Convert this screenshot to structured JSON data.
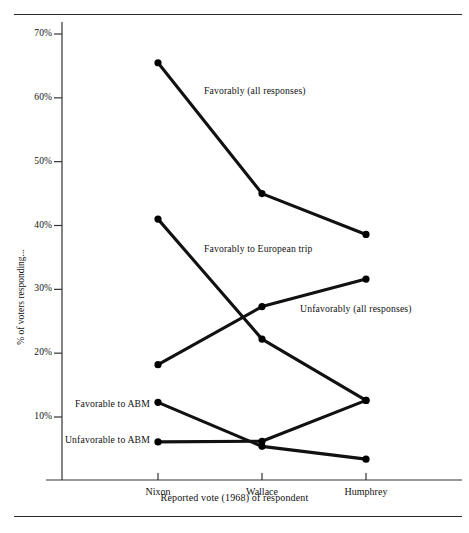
{
  "chart_data": {
    "type": "line",
    "title": "",
    "xlabel": "Reported vote (1968) of respondent",
    "ylabel": "% of voters responding...",
    "categories": [
      "Nixon",
      "Wallace",
      "Humphrey"
    ],
    "ylim": [
      0,
      72
    ],
    "yticks": [
      10,
      20,
      30,
      40,
      50,
      60,
      70
    ],
    "ytick_labels": [
      "10%",
      "20%",
      "30%",
      "40%",
      "50%",
      "60%",
      "70%"
    ],
    "grid": false,
    "legend_position": "inline-annotations",
    "series": [
      {
        "name": "Favorably (all responses)",
        "label": "Favorably (all responses)",
        "values": [
          65.5,
          45.0,
          38.6
        ],
        "label_x_px": 204,
        "label_y_px": 85,
        "label_align": "left"
      },
      {
        "name": "Favorably to European trip",
        "label": "Favorably to European trip",
        "values": [
          41.0,
          22.2,
          12.6
        ],
        "label_x_px": 204,
        "label_y_px": 243,
        "label_align": "left"
      },
      {
        "name": "Unfavorably (all responses)",
        "label": "Unfavorably (all responses)",
        "values": [
          18.2,
          27.3,
          31.6
        ],
        "label_x_px": 300,
        "label_y_px": 303,
        "label_align": "left"
      },
      {
        "name": "Favorable to ABM",
        "label": "Favorable to ABM",
        "values": [
          12.3,
          5.4,
          3.4
        ],
        "label_x_px": 150,
        "label_y_px": 398,
        "label_align": "right"
      },
      {
        "name": "Unfavorable to ABM",
        "label": "Unfavorable to ABM",
        "values": [
          6.1,
          6.2,
          12.6
        ],
        "label_x_px": 150,
        "label_y_px": 434,
        "label_align": "right"
      }
    ],
    "colors": {
      "line": "#111111",
      "marker": "#000000",
      "axis": "#333333",
      "rule": "#2a2a2a",
      "background": "#ffffff"
    }
  },
  "axis": {
    "x_tick_labels": [
      "Nixon",
      "Wallace",
      "Humphrey"
    ],
    "y_tick_labels": [
      "70%",
      "60%",
      "50%",
      "40%",
      "30%",
      "20%",
      "10%"
    ],
    "x_title": "Reported vote (1968) of respondent",
    "y_title": "% of voters responding..."
  }
}
